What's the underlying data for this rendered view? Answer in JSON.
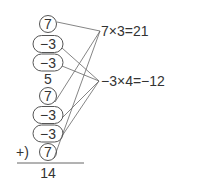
{
  "terms": [
    {
      "value": "7",
      "shape": "circle",
      "group": "seven"
    },
    {
      "value": "−3",
      "shape": "oval",
      "group": "minus-three"
    },
    {
      "value": "−3",
      "shape": "oval",
      "group": "minus-three"
    },
    {
      "value": "5",
      "shape": "none",
      "group": "none"
    },
    {
      "value": "7",
      "shape": "circle",
      "group": "seven"
    },
    {
      "value": "−3",
      "shape": "oval",
      "group": "minus-three"
    },
    {
      "value": "−3",
      "shape": "oval",
      "group": "minus-three"
    },
    {
      "value": "7",
      "shape": "circle",
      "group": "seven"
    }
  ],
  "plus_sign": "+)",
  "total": "14",
  "equations": {
    "seven": "7×3=21",
    "minus_three": "−3×4=−12"
  },
  "colors": {
    "stroke": "#555555",
    "text": "#333333"
  }
}
